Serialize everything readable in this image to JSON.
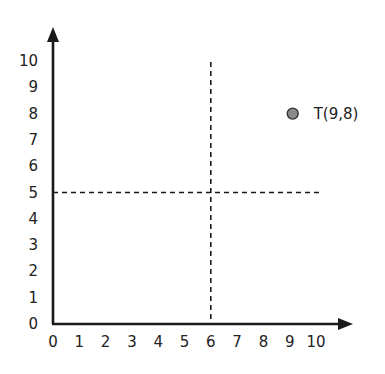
{
  "chart_data": {
    "type": "scatter",
    "title": "",
    "xlabel": "",
    "ylabel": "",
    "xlim": [
      0,
      10
    ],
    "ylim": [
      0,
      10
    ],
    "grid": false,
    "x_ticks": [
      "0",
      "1",
      "2",
      "3",
      "4",
      "5",
      "6",
      "7",
      "8",
      "9",
      "10"
    ],
    "y_ticks": [
      "0",
      "1",
      "2",
      "3",
      "4",
      "5",
      "6",
      "7",
      "8",
      "9",
      "10"
    ],
    "points": [
      {
        "label": "T(9,8)",
        "x": 9,
        "y": 8,
        "color": "#8a8a8a"
      }
    ],
    "reference_lines": [
      {
        "orientation": "vertical",
        "x": 6,
        "style": "dashed"
      },
      {
        "orientation": "horizontal",
        "y": 5,
        "style": "dashed"
      }
    ],
    "colors": {
      "axis": "#1a1a1a",
      "point_fill": "#8a8a8a",
      "point_stroke": "#333333"
    }
  }
}
